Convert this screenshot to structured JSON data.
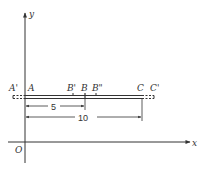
{
  "diagram": {
    "axes": {
      "x_label": "x",
      "y_label": "y",
      "origin_label": "O"
    },
    "points": {
      "a_prime": "A'",
      "a": "A",
      "b_prime": "B'",
      "b": "B",
      "b_double_prime": "B\"",
      "c": "C",
      "c_prime": "C'"
    },
    "dimensions": {
      "ab_length": "5",
      "ac_length": "10"
    },
    "colors": {
      "line": "#333333",
      "background": "#ffffff"
    }
  }
}
